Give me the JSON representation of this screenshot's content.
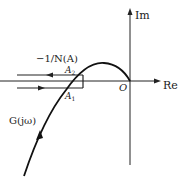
{
  "diagram": {
    "axes": {
      "re_label": "Re",
      "im_label": "Im",
      "origin_label": "O"
    },
    "curves": {
      "nyquist_label": "G(jω)",
      "describing_function_label": "−1/N(A)"
    },
    "points": {
      "a2": {
        "base": "A",
        "sub": "2"
      },
      "a1": {
        "base": "A",
        "sub": "1"
      }
    },
    "colors": {
      "stroke": "#111111",
      "background": "#ffffff"
    }
  }
}
